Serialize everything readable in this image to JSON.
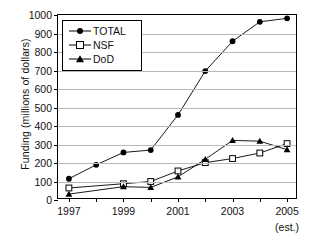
{
  "chart_data": {
    "type": "line",
    "title": "",
    "xlabel": "",
    "ylabel": "Funding (millions of dollars)",
    "x": [
      1997,
      1998,
      1999,
      2000,
      2001,
      2002,
      2003,
      2004,
      2005
    ],
    "xlim": [
      1996.6,
      2005.4
    ],
    "ylim": [
      0,
      1000
    ],
    "grid": true,
    "legend_position": "top-left",
    "xtick_labels": [
      "1997",
      "1999",
      "2001",
      "2003",
      "2005"
    ],
    "xtick_values": [
      1997,
      1999,
      2001,
      2003,
      2005
    ],
    "xtick_minor_values": [
      1998,
      2000,
      2002,
      2004
    ],
    "xtick_sublabels": [
      {
        "x": 2005,
        "text": "(est.)"
      }
    ],
    "ytick_labels": [
      "0",
      "100",
      "200",
      "300",
      "400",
      "500",
      "600",
      "700",
      "800",
      "900",
      "1000"
    ],
    "ytick_values": [
      0,
      100,
      200,
      300,
      400,
      500,
      600,
      700,
      800,
      900,
      1000
    ],
    "series": [
      {
        "name": "TOTAL",
        "marker": "filled-circle",
        "color": "#000000",
        "x": [
          1997,
          1998,
          1999,
          2000,
          2001,
          2002,
          2003,
          2004,
          2005
        ],
        "values": [
          115,
          190,
          257,
          270,
          460,
          697,
          858,
          963,
          982
        ]
      },
      {
        "name": "NSF",
        "marker": "open-square",
        "color": "#000000",
        "x": [
          1997,
          1999,
          2000,
          2001,
          2002,
          2003,
          2004,
          2005
        ],
        "values": [
          65,
          88,
          100,
          157,
          202,
          224,
          254,
          305
        ]
      },
      {
        "name": "DoD",
        "marker": "filled-triangle",
        "color": "#000000",
        "x": [
          1997,
          1999,
          2000,
          2001,
          2002,
          2003,
          2004,
          2005
        ],
        "values": [
          32,
          72,
          68,
          125,
          220,
          322,
          318,
          272
        ]
      }
    ]
  },
  "legend": {
    "items": [
      {
        "label": "TOTAL",
        "marker": "filled-circle"
      },
      {
        "label": "NSF",
        "marker": "open-square"
      },
      {
        "label": "DoD",
        "marker": "filled-triangle"
      }
    ]
  }
}
